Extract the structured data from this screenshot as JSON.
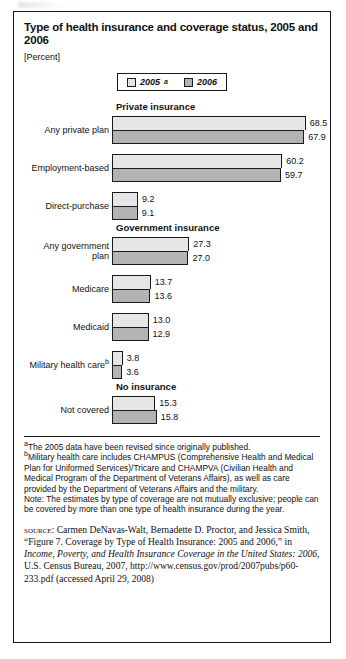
{
  "figure": {
    "title": "Type of health insurance and coverage status, 2005 and 2006",
    "unit": "[Percent]"
  },
  "legend": {
    "items": [
      {
        "label": "2005",
        "sup": "a",
        "swatch": "light",
        "color": "#e6e6e6"
      },
      {
        "label": "2006",
        "sup": "",
        "swatch": "dark",
        "color": "#b3b3b3"
      }
    ]
  },
  "sections": [
    {
      "title": "Private insurance",
      "groups": [
        {
          "label": "Any private plan",
          "sup": "",
          "v2005": "68.5",
          "v2006": "67.9"
        },
        {
          "label": "Employment-based",
          "sup": "",
          "v2005": "60.2",
          "v2006": "59.7"
        },
        {
          "label": "Direct-purchase",
          "sup": "",
          "v2005": "9.2",
          "v2006": "9.1"
        }
      ]
    },
    {
      "title": "Government insurance",
      "groups": [
        {
          "label": "Any government plan",
          "sup": "",
          "v2005": "27.3",
          "v2006": "27.0"
        },
        {
          "label": "Medicare",
          "sup": "",
          "v2005": "13.7",
          "v2006": "13.6"
        },
        {
          "label": "Medicaid",
          "sup": "",
          "v2005": "13.0",
          "v2006": "12.9"
        },
        {
          "label": "Military health care",
          "sup": "b",
          "v2005": "3.8",
          "v2006": "3.6"
        }
      ]
    },
    {
      "title": "No insurance",
      "groups": [
        {
          "label": "Not covered",
          "sup": "",
          "v2005": "15.3",
          "v2006": "15.8"
        }
      ]
    }
  ],
  "notes": {
    "footnote_a": "The 2005 data have been revised since originally published.",
    "footnote_a_marker": "a",
    "footnote_b": "Military health care includes CHAMPUS (Comprehensive Health and Medical Plan for Uniformed Services)/Tricare and CHAMPVA (Civilian Health and Medical Program of the Department of Veterans Affairs), as well as care provided by the Department of Veterans Affairs and the military.",
    "footnote_b_marker": "b",
    "note": "Note: The estimates by type of coverage are not mutually exclusive; people can be covered by more than one type of health insurance during the year."
  },
  "source": {
    "keyword": "source:",
    "text_1": " Carmen DeNavas-Walt, Bernadette D. Proctor, and Jessica Smith, “Figure 7. Coverage by Type of Health Insurance: 2005 and 2006,” in ",
    "italic_1": "Income, Poverty, and Health Insurance Coverage in the United States: 2006",
    "text_2": ", U.S. Census Bureau, 2007, http://www.census.gov/prod/2007pubs/p60-233.pdf (accessed April 29, 2008)"
  },
  "chart_data": {
    "type": "bar",
    "title": "Type of health insurance and coverage status, 2005 and 2006",
    "xlabel": "Percent",
    "ylabel": "",
    "orientation": "horizontal",
    "grid": false,
    "legend_position": "top-center",
    "xlim": [
      0,
      68.5
    ],
    "px_per_unit": 2.83,
    "categories": [
      "Any private plan",
      "Employment-based",
      "Direct-purchase",
      "Any government plan",
      "Medicare",
      "Medicaid",
      "Military health care",
      "Not covered"
    ],
    "series": [
      {
        "name": "2005",
        "color": "#e6e6e6",
        "values": [
          68.5,
          60.2,
          9.2,
          27.3,
          13.7,
          13.0,
          3.8,
          15.3
        ]
      },
      {
        "name": "2006",
        "color": "#b3b3b3",
        "values": [
          67.9,
          59.7,
          9.1,
          27.0,
          13.6,
          12.9,
          3.6,
          15.8
        ]
      }
    ],
    "groups": [
      {
        "section": "Private insurance",
        "categories": [
          "Any private plan",
          "Employment-based",
          "Direct-purchase"
        ]
      },
      {
        "section": "Government insurance",
        "categories": [
          "Any government plan",
          "Medicare",
          "Medicaid",
          "Military health care"
        ]
      },
      {
        "section": "No insurance",
        "categories": [
          "Not covered"
        ]
      }
    ]
  }
}
